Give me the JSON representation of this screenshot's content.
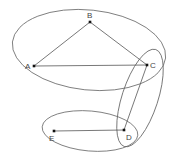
{
  "diagram": {
    "type": "graph-with-hyperedges",
    "nodes": [
      {
        "id": "A",
        "label": "A",
        "x": 34,
        "y": 66,
        "label_x": 25,
        "label_y": 69
      },
      {
        "id": "B",
        "label": "B",
        "x": 90,
        "y": 22,
        "label_x": 87,
        "label_y": 18
      },
      {
        "id": "C",
        "label": "C",
        "x": 147,
        "y": 65,
        "label_x": 150,
        "label_y": 68
      },
      {
        "id": "D",
        "label": "D",
        "x": 124,
        "y": 130,
        "label_x": 126,
        "label_y": 140
      },
      {
        "id": "E",
        "label": "E",
        "x": 54,
        "y": 131,
        "label_x": 49,
        "label_y": 141
      }
    ],
    "edges": [
      {
        "from": "A",
        "to": "B"
      },
      {
        "from": "B",
        "to": "C"
      },
      {
        "from": "A",
        "to": "C"
      },
      {
        "from": "C",
        "to": "D"
      },
      {
        "from": "E",
        "to": "D"
      }
    ],
    "groups": [
      {
        "members": [
          "A",
          "B",
          "C"
        ],
        "cx": 89,
        "cy": 50,
        "rx": 77,
        "ry": 40,
        "rotate": 6
      },
      {
        "members": [
          "C",
          "D"
        ],
        "cx": 140,
        "cy": 98,
        "rx": 51,
        "ry": 18,
        "rotate": -72
      },
      {
        "members": [
          "D",
          "E"
        ],
        "cx": 90,
        "cy": 131,
        "rx": 48,
        "ry": 20,
        "rotate": 5
      }
    ]
  }
}
